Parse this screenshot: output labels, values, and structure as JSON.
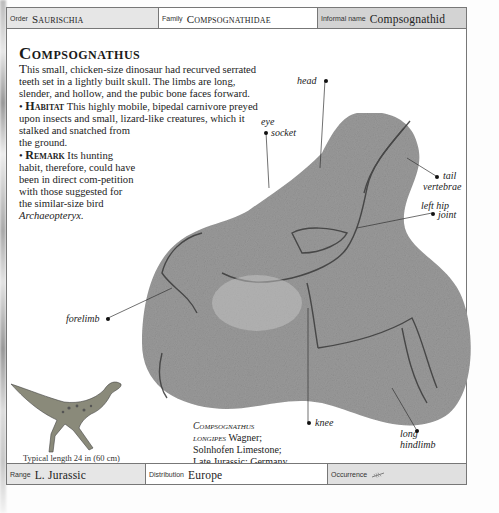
{
  "header": {
    "order": {
      "label": "Order",
      "value": "Saurischia"
    },
    "family": {
      "label": "Family",
      "value": "Compsognathidae"
    },
    "informal_name": {
      "label": "Informal name",
      "value": "Compsognathid"
    }
  },
  "entry": {
    "title": "Compsognathus",
    "intro_first": "T",
    "intro_rest": "his small, chicken-size dinosaur had recurved serrated teeth set in a lightly built skull. The limbs are long, slender, and hollow, and the pubic bone faces forward.",
    "habitat_keyword": "Habitat",
    "habitat_text_a": "This highly mobile, bipedal carnivore preyed upon insects and small, lizard-like creatures, which it",
    "habitat_text_b": "stalked and snatched from the ground.",
    "remark_keyword": "Remark",
    "remark_text": "Its hunting habit, therefore, could have been in direct com-petition with those suggested for the similar-size bird",
    "remark_italic": "Archaeopteryx."
  },
  "figure_labels": {
    "head": "head",
    "eye_socket_1": "eye",
    "eye_socket_2": "socket",
    "tail_vertebrae_1": "tail",
    "tail_vertebrae_2": "vertebrae",
    "left_hip_joint_1": "left hip",
    "left_hip_joint_2": "joint",
    "forelimb": "forelimb",
    "knee": "knee",
    "long_hindlimb_1": "long",
    "long_hindlimb_2": "hindlimb"
  },
  "caption": {
    "species_1": "Compsognathus",
    "species_2": "longipes",
    "author": " Wagner;",
    "line2": "Solnhofen Limestone;",
    "line3": "Late Jurassic; Germany."
  },
  "typical_length": "Typical length 24 in (60 cm)",
  "footer": {
    "range": {
      "label": "Range",
      "value": "L. Jurassic"
    },
    "distribution": {
      "label": "Distribution",
      "value": "Europe"
    },
    "occurrence": {
      "label": "Occurrence",
      "icon": "fern-frond-icon"
    }
  }
}
